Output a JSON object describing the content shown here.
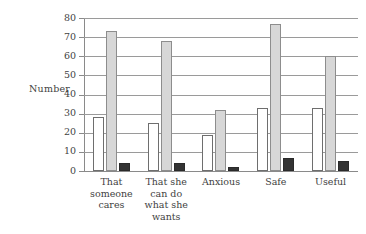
{
  "chart_data": {
    "type": "bar",
    "title": "",
    "xlabel": "",
    "ylabel": "Number",
    "ylim": [
      0,
      80
    ],
    "yticks": [
      0,
      10,
      20,
      30,
      40,
      50,
      60,
      70,
      80
    ],
    "ytick_labels": [
      "0",
      "10",
      "20",
      "30",
      "40",
      "50",
      "60",
      "70",
      "80"
    ],
    "grid": true,
    "legend": false,
    "categories": [
      "That someone cares",
      "That she can do what she wants",
      "Anxious",
      "Safe",
      "Useful"
    ],
    "category_lines": [
      [
        "That",
        "someone",
        "cares"
      ],
      [
        "That she",
        "can do",
        "what she",
        "wants"
      ],
      [
        "Anxious"
      ],
      [
        "Safe"
      ],
      [
        "Useful"
      ]
    ],
    "series": [
      {
        "name": "series-1",
        "style": "white",
        "color": "#ffffff",
        "values": [
          28,
          25,
          19,
          33,
          33
        ]
      },
      {
        "name": "series-2",
        "style": "gray",
        "color": "#d7d7d7",
        "values": [
          73,
          68,
          32,
          77,
          60
        ]
      },
      {
        "name": "series-3",
        "style": "dark",
        "color": "#333333",
        "values": [
          4,
          4,
          2,
          7,
          5
        ]
      }
    ]
  },
  "axis": {
    "y_title": "Number"
  }
}
